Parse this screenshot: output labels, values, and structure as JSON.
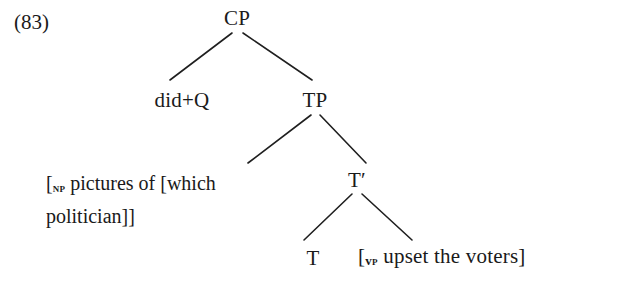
{
  "diagram": {
    "type": "syntax-tree",
    "example_number": "(83)",
    "nodes": {
      "cp": {
        "label": "CP",
        "x": 237,
        "y": 8
      },
      "did_q": {
        "label": "did+Q",
        "x": 182,
        "y": 90
      },
      "tp": {
        "label": "TP",
        "x": 315,
        "y": 90
      },
      "np_phrase": {
        "open_bracket": "[",
        "subscript": "NP",
        "text_before": " pictures of [which",
        "text_after": "politician]]",
        "x": 48,
        "y": 168
      },
      "tbar": {
        "label": "T",
        "prime": "′",
        "x": 357,
        "y": 170
      },
      "t": {
        "label": "T",
        "x": 313,
        "y": 248
      },
      "vp_phrase": {
        "open_bracket": "[",
        "subscript_v": "v",
        "subscript_p": "P",
        "text": " upset the voters]",
        "x": 358,
        "y": 246
      }
    },
    "branches": [
      {
        "name": "cp-to-did-q",
        "x1": 232,
        "y1": 33,
        "x2": 170,
        "y2": 80
      },
      {
        "name": "cp-to-tp",
        "x1": 243,
        "y1": 33,
        "x2": 312,
        "y2": 80
      },
      {
        "name": "tp-to-np",
        "x1": 311,
        "y1": 115,
        "x2": 248,
        "y2": 163
      },
      {
        "name": "tp-to-tbar",
        "x1": 320,
        "y1": 115,
        "x2": 366,
        "y2": 163
      },
      {
        "name": "tbar-to-t",
        "x1": 352,
        "y1": 194,
        "x2": 304,
        "y2": 240
      },
      {
        "name": "tbar-to-vp",
        "x1": 362,
        "y1": 194,
        "x2": 412,
        "y2": 240
      }
    ],
    "style": {
      "ink_color": "#1a1a1a",
      "line_color": "#1f1f1f",
      "background": "#ffffff"
    }
  }
}
